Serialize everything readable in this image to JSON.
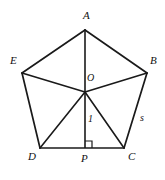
{
  "figure": {
    "name": "regular-pentagon-with-apothem",
    "background_color": "#ffffff",
    "stroke_color": "#1a1a1a",
    "vertices": [
      {
        "id": "A",
        "label": "A",
        "x": 85,
        "y": 30,
        "label_x": 83,
        "label_y": 10
      },
      {
        "id": "B",
        "label": "B",
        "x": 147,
        "y": 73,
        "label_x": 150,
        "label_y": 55
      },
      {
        "id": "C",
        "label": "C",
        "x": 124,
        "y": 148,
        "label_x": 128,
        "label_y": 151
      },
      {
        "id": "D",
        "label": "D",
        "x": 40,
        "y": 148,
        "label_x": 28,
        "label_y": 151
      },
      {
        "id": "E",
        "label": "E",
        "x": 22,
        "y": 73,
        "label_x": 10,
        "label_y": 55
      }
    ],
    "center": {
      "id": "O",
      "label": "O",
      "x": 85,
      "y": 92,
      "label_x": 87,
      "label_y": 73
    },
    "foot": {
      "id": "P",
      "label": "P",
      "x": 85,
      "y": 148,
      "label_x": 81,
      "label_y": 153
    },
    "edges": [
      {
        "from": "A",
        "to": "B"
      },
      {
        "from": "B",
        "to": "C"
      },
      {
        "from": "C",
        "to": "D"
      },
      {
        "from": "D",
        "to": "E"
      },
      {
        "from": "E",
        "to": "A"
      }
    ],
    "radii": [
      {
        "from": "O",
        "to": "A"
      },
      {
        "from": "O",
        "to": "B"
      },
      {
        "from": "O",
        "to": "C"
      },
      {
        "from": "O",
        "to": "D"
      },
      {
        "from": "O",
        "to": "E"
      }
    ],
    "apothem": {
      "from": "O",
      "to": "P",
      "length_label": "1",
      "label_x": 88,
      "label_y": 114
    },
    "side_label": {
      "text": "s",
      "on_edge": "BC",
      "label_x": 140,
      "label_y": 113
    },
    "right_angle_marker": {
      "at": "P",
      "size": 7
    }
  }
}
